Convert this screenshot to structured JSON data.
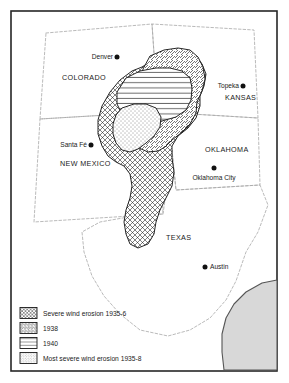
{
  "figure": {
    "type": "thematic-map",
    "region": "United States Southern Great Plains"
  },
  "states": [
    {
      "id": "colorado",
      "label": "COLORADO",
      "x": 62,
      "y": 80
    },
    {
      "id": "kansas",
      "label": "KANSAS",
      "x": 225,
      "y": 100
    },
    {
      "id": "new-mexico",
      "label": "NEW MEXICO",
      "x": 60,
      "y": 166
    },
    {
      "id": "oklahoma",
      "label": "OKLAHOMA",
      "x": 205,
      "y": 152
    },
    {
      "id": "texas",
      "label": "TEXAS",
      "x": 166,
      "y": 240
    }
  ],
  "cities": [
    {
      "id": "denver",
      "label": "Denver",
      "dot_x": 117,
      "dot_y": 57,
      "label_x": 113,
      "label_y": 59,
      "anchor": "end"
    },
    {
      "id": "topeka",
      "label": "Topeka",
      "dot_x": 243,
      "dot_y": 86,
      "label_x": 239,
      "label_y": 88,
      "anchor": "end"
    },
    {
      "id": "santa-fe",
      "label": "Santa Fé",
      "dot_x": 91,
      "dot_y": 145,
      "label_x": 87,
      "label_y": 147,
      "anchor": "end"
    },
    {
      "id": "oklahoma-city",
      "label": "Oklahoma City",
      "dot_x": 214,
      "dot_y": 168,
      "label_x": 214,
      "label_y": 180,
      "anchor": "middle"
    },
    {
      "id": "austin",
      "label": "Austin",
      "dot_x": 205,
      "dot_y": 267,
      "label_x": 210,
      "label_y": 269,
      "anchor": "start"
    }
  ],
  "legend": {
    "items": [
      {
        "id": "severe-1935-6",
        "pattern": "crosshatch",
        "label": "Severe wind erosion 1935-6"
      },
      {
        "id": "extent-1938",
        "pattern": "diagonal",
        "label": "1938"
      },
      {
        "id": "extent-1940",
        "pattern": "horizontal",
        "label": "1940"
      },
      {
        "id": "most-severe-1935-8",
        "pattern": "stipple",
        "label": "Most severe wind erosion 1935-8"
      }
    ]
  },
  "map_data": {
    "type": "choropleth-overlay",
    "layers": [
      {
        "id": "severe-1935-6",
        "pattern": "crosshatch",
        "label": "Severe wind erosion 1935-6",
        "order": 1
      },
      {
        "id": "extent-1938",
        "pattern": "diagonal",
        "label": "1938",
        "order": 2
      },
      {
        "id": "extent-1940",
        "pattern": "horizontal",
        "label": "1940",
        "order": 3
      },
      {
        "id": "most-severe-1935-8",
        "pattern": "stipple",
        "label": "Most severe wind erosion 1935-8",
        "order": 4
      }
    ],
    "water_body": "Gulf of Mexico"
  },
  "colors": {
    "frame": "#262626",
    "state_border": "#a8a8a8",
    "ink": "#1a1a1a",
    "water_fill": "#d8d8d8",
    "coast_stroke": "#555555",
    "paper": "#ffffff"
  }
}
